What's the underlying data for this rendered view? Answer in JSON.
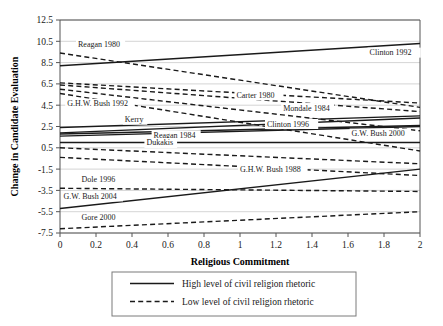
{
  "chart_data": {
    "type": "line",
    "title": "",
    "xlabel": "Religious Commitment",
    "ylabel": "Change in Candidate Evaluation",
    "xlim": [
      0,
      2
    ],
    "ylim": [
      -7.5,
      12.5
    ],
    "xticks": [
      "0",
      "0.2",
      "0.4",
      "0.6",
      "0.8",
      "1",
      "1.2",
      "1.4",
      "1.6",
      "1.8",
      "2"
    ],
    "xtickvals": [
      0,
      0.2,
      0.4,
      0.6,
      0.8,
      1,
      1.2,
      1.4,
      1.6,
      1.8,
      2
    ],
    "yticks": [
      "12.5",
      "10.5",
      "8.5",
      "6.5",
      "4.5",
      "2.5",
      "0.5",
      "-1.5",
      "-3.5",
      "-5.5",
      "-7.5"
    ],
    "ytickvals": [
      12.5,
      10.5,
      8.5,
      6.5,
      4.5,
      2.5,
      0.5,
      -1.5,
      -3.5,
      -5.5,
      -7.5
    ],
    "grid": true,
    "legend_position": "below",
    "legend": [
      {
        "label": "High level of civil religion rhetoric",
        "style": "solid"
      },
      {
        "label": "Low level of civil religion rhetoric",
        "style": "dashed"
      }
    ],
    "series": [
      {
        "name": "Clinton 1992",
        "style": "solid",
        "x": [
          0,
          2
        ],
        "y": [
          8.2,
          10.3
        ],
        "label_x": 1.72,
        "label_y": 9.2
      },
      {
        "name": "Reagan 1980",
        "style": "dashed",
        "x": [
          0,
          2
        ],
        "y": [
          9.4,
          4.3
        ],
        "label_x": 0.1,
        "label_y": 10.0
      },
      {
        "name": "Carter 1980",
        "style": "dashed",
        "x": [
          0,
          2
        ],
        "y": [
          6.6,
          4.7
        ],
        "label_x": 0.98,
        "label_y": 5.2
      },
      {
        "name": "Mondale 1984",
        "style": "dashed",
        "x": [
          0,
          2
        ],
        "y": [
          6.4,
          3.9
        ],
        "label_x": 1.24,
        "label_y": 4.0
      },
      {
        "name": "G.H.W. Bush 1992",
        "style": "dashed",
        "x": [
          0,
          2
        ],
        "y": [
          6.0,
          2.1
        ],
        "label_x": 0.04,
        "label_y": 4.4
      },
      {
        "name": "Kerry",
        "style": "solid",
        "x": [
          0,
          2
        ],
        "y": [
          2.4,
          3.5
        ],
        "label_x": 0.36,
        "label_y": 2.9
      },
      {
        "name": "Clinton 1996",
        "style": "solid",
        "x": [
          0,
          2
        ],
        "y": [
          1.9,
          3.3
        ],
        "label_x": 1.15,
        "label_y": 2.5
      },
      {
        "name": "G.W. Bush 2000",
        "style": "solid",
        "x": [
          0,
          2
        ],
        "y": [
          1.8,
          2.6
        ],
        "label_x": 1.62,
        "label_y": 1.6
      },
      {
        "name": "Reagan 1984",
        "style": "solid",
        "x": [
          0,
          2
        ],
        "y": [
          1.6,
          2.5
        ],
        "label_x": 0.52,
        "label_y": 1.45
      },
      {
        "name": "Dukakis",
        "style": "solid",
        "x": [
          0,
          2
        ],
        "y": [
          1.0,
          1.0
        ],
        "label_x": 0.48,
        "label_y": 0.72
      },
      {
        "name": "Dukakis-low",
        "style": "dashed",
        "x": [
          0,
          2
        ],
        "y": [
          0.5,
          -1.0
        ],
        "label_x": null,
        "label_y": null
      },
      {
        "name": "Clinton1996-low",
        "style": "dashed",
        "x": [
          0,
          2
        ],
        "y": [
          5.6,
          0.2
        ],
        "label_x": null,
        "label_y": null
      },
      {
        "name": "G.H.W. Bush 1988",
        "style": "dashed",
        "x": [
          0,
          2
        ],
        "y": [
          -0.4,
          -2.1
        ],
        "label_x": 1.0,
        "label_y": -1.75
      },
      {
        "name": "Dole 1996",
        "style": "dashed",
        "x": [
          0,
          2
        ],
        "y": [
          -3.3,
          -3.6
        ],
        "label_x": 0.12,
        "label_y": -2.7
      },
      {
        "name": "G.W. Bush 2004",
        "style": "solid",
        "x": [
          0,
          2
        ],
        "y": [
          -5.2,
          -1.5
        ],
        "label_x": 0.02,
        "label_y": -4.3
      },
      {
        "name": "Gore 2000",
        "style": "dashed",
        "x": [
          0,
          2
        ],
        "y": [
          -7.1,
          -5.5
        ],
        "label_x": 0.12,
        "label_y": -6.3
      }
    ]
  }
}
